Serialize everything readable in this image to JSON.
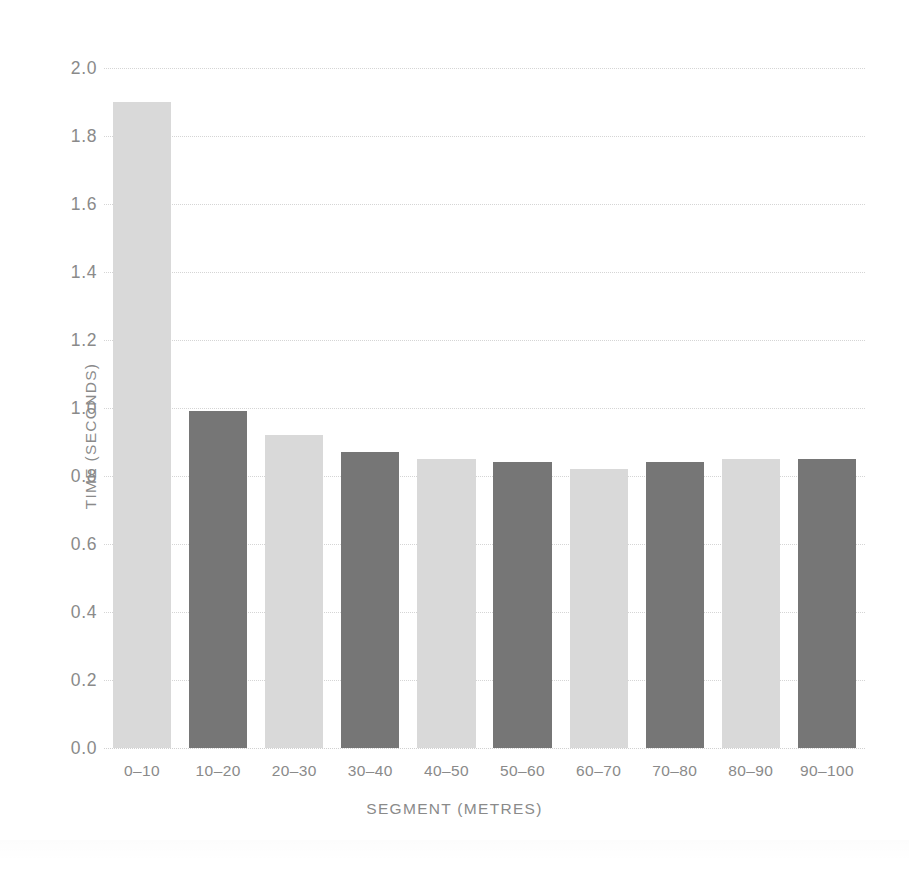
{
  "chart_data": {
    "type": "bar",
    "title": "",
    "xlabel": "SEGMENT (METRES)",
    "ylabel": "TIME (SECONDS)",
    "categories": [
      "0–10",
      "10–20",
      "20–30",
      "30–40",
      "40–50",
      "50–60",
      "60–70",
      "70–80",
      "80–90",
      "90–100"
    ],
    "values": [
      1.9,
      0.99,
      0.92,
      0.87,
      0.85,
      0.84,
      0.82,
      0.84,
      0.85,
      0.85
    ],
    "bar_colors": [
      "#d9d9d9",
      "#767676",
      "#d9d9d9",
      "#767676",
      "#d9d9d9",
      "#767676",
      "#d9d9d9",
      "#767676",
      "#d9d9d9",
      "#767676"
    ],
    "ylim": [
      0.0,
      2.0
    ],
    "ytick_values": [
      0.0,
      0.2,
      0.4,
      0.6,
      0.8,
      1.0,
      1.2,
      1.4,
      1.6,
      1.8,
      2.0
    ],
    "ytick_labels": [
      "0.0",
      "0.2",
      "0.4",
      "0.6",
      "0.8",
      "1.0",
      "1.2",
      "1.4",
      "1.6",
      "1.8",
      "2.0"
    ],
    "grid": true,
    "grid_axis": "y",
    "grid_style": "dotted",
    "legend": "none"
  },
  "colors": {
    "background": "#ffffff",
    "bar_light": "#d9d9d9",
    "bar_dark": "#767676",
    "gridline": "#d5d5d5",
    "text": "#8a8a8a"
  }
}
